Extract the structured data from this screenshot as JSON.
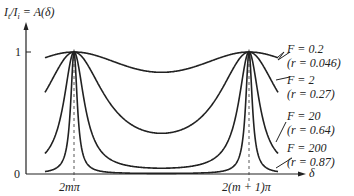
{
  "chart_data": {
    "type": "line",
    "title": "",
    "ylabel": "I_t/I_i = A(δ)",
    "xlabel": "δ",
    "xticks": [
      "2mπ",
      "2(m + 1)π"
    ],
    "yticks": [
      "0",
      "1"
    ],
    "ylim": [
      0,
      1
    ],
    "grid": false,
    "series": [
      {
        "name": "F = 0.2 (r = 0.046)",
        "F": 0.2,
        "r": 0.046,
        "min": 0.83
      },
      {
        "name": "F = 2 (r = 0.27)",
        "F": 2,
        "r": 0.27,
        "min": 0.33
      },
      {
        "name": "F = 20 (r = 0.64)",
        "F": 20,
        "r": 0.64,
        "min": 0.048
      },
      {
        "name": "F = 200 (r = 0.87)",
        "F": 200,
        "r": 0.87,
        "min": 0.005
      }
    ],
    "annotations": [
      "dashed vertical lines at peaks 2mπ and 2(m+1)π"
    ]
  },
  "labels": {
    "ylabel_a": "I",
    "ylabel_sub_t": "t",
    "ylabel_b": "/I",
    "ylabel_sub_i": "i",
    "ylabel_c": " = A(δ)",
    "one": "1",
    "zero": "0",
    "x1": "2mπ",
    "x2": "2(m + 1)π",
    "delta": "δ",
    "s1a": "F = 0.2",
    "s1b": "(r = 0.046)",
    "s2a": "F = 2",
    "s2b": "(r = 0.27)",
    "s3a": "F = 20",
    "s3b": "(r = 0.64)",
    "s4a": "F = 200",
    "s4b": "(r = 0.87)"
  }
}
